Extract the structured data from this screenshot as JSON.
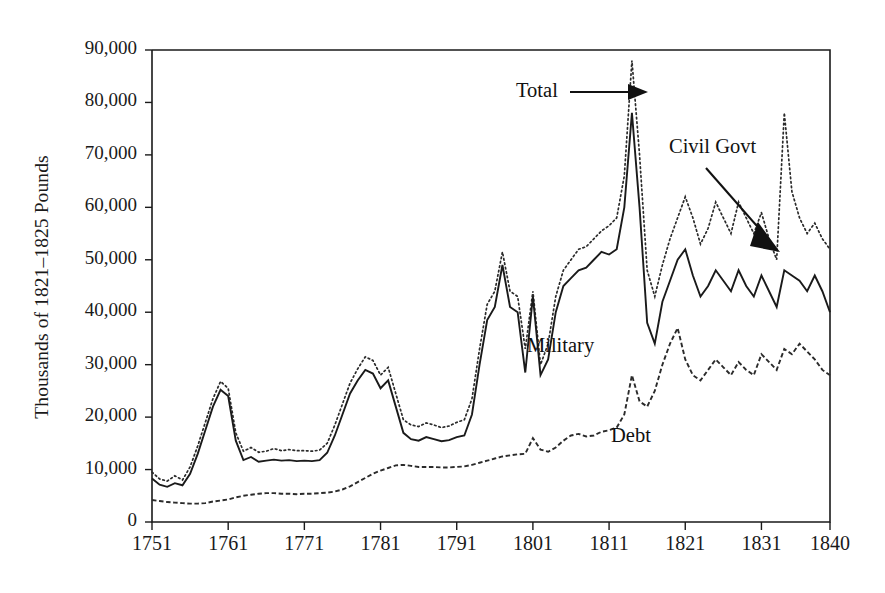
{
  "chart_data": {
    "type": "line",
    "title": "",
    "xlabel": "",
    "ylabel": "Thousands of 1821–1825 Pounds",
    "xlim": [
      1751,
      1840
    ],
    "ylim": [
      0,
      90000
    ],
    "grid": false,
    "legend_position": "inline-annotations",
    "x_ticks": [
      "1751",
      "1761",
      "1771",
      "1781",
      "1791",
      "1801",
      "1811",
      "1821",
      "1831",
      "1840"
    ],
    "x_tick_values": [
      1751,
      1761,
      1771,
      1781,
      1791,
      1801,
      1811,
      1821,
      1831,
      1840
    ],
    "y_ticks": [
      "0",
      "10,000",
      "20,000",
      "30,000",
      "40,000",
      "50,000",
      "60,000",
      "70,000",
      "80,000",
      "90,000"
    ],
    "y_tick_values": [
      0,
      10000,
      20000,
      30000,
      40000,
      50000,
      60000,
      70000,
      80000,
      90000
    ],
    "annotations": [
      {
        "text": "Total",
        "series": "Total",
        "arrow": "right"
      },
      {
        "text": "Civil Govt",
        "series": "Civil Govt",
        "arrow": "down-right"
      },
      {
        "text": "Military",
        "series": "Military",
        "arrow": "none"
      },
      {
        "text": "Debt",
        "series": "Debt",
        "arrow": "none"
      }
    ],
    "x": [
      1751,
      1752,
      1753,
      1754,
      1755,
      1756,
      1757,
      1758,
      1759,
      1760,
      1761,
      1762,
      1763,
      1764,
      1765,
      1766,
      1767,
      1768,
      1769,
      1770,
      1771,
      1772,
      1773,
      1774,
      1775,
      1776,
      1777,
      1778,
      1779,
      1780,
      1781,
      1782,
      1783,
      1784,
      1785,
      1786,
      1787,
      1788,
      1789,
      1790,
      1791,
      1792,
      1793,
      1794,
      1795,
      1796,
      1797,
      1798,
      1799,
      1800,
      1801,
      1802,
      1803,
      1804,
      1805,
      1806,
      1807,
      1808,
      1809,
      1810,
      1811,
      1812,
      1813,
      1814,
      1815,
      1816,
      1817,
      1818,
      1819,
      1820,
      1821,
      1822,
      1823,
      1824,
      1825,
      1826,
      1827,
      1828,
      1829,
      1830,
      1831,
      1832,
      1833,
      1834,
      1835,
      1836,
      1837,
      1838,
      1839,
      1840
    ],
    "series": [
      {
        "name": "Total",
        "style": "dotted",
        "values": [
          9500,
          8200,
          7800,
          8800,
          8000,
          10500,
          14500,
          19000,
          23500,
          26800,
          25500,
          17000,
          13500,
          14200,
          13300,
          13500,
          14000,
          13600,
          13800,
          13600,
          13600,
          13500,
          13700,
          15000,
          18500,
          22500,
          26500,
          29200,
          31500,
          30800,
          28000,
          29500,
          24500,
          19500,
          18500,
          18200,
          18900,
          18500,
          18000,
          18300,
          19000,
          19500,
          23500,
          33000,
          41500,
          44000,
          51500,
          44000,
          43000,
          33000,
          44000,
          30000,
          34000,
          43000,
          48000,
          50000,
          52000,
          52500,
          54000,
          55500,
          56500,
          58000,
          66000,
          88000,
          70000,
          48000,
          43000,
          49000,
          54000,
          58000,
          62000,
          58000,
          53000,
          56000,
          61000,
          58000,
          55000,
          61000,
          58000,
          55000,
          59000,
          54000,
          50000,
          78000,
          63000,
          58000,
          55000,
          57000,
          54000,
          52000
        ]
      },
      {
        "name": "Military",
        "style": "solid",
        "values": [
          8300,
          7100,
          6700,
          7400,
          7000,
          9200,
          13000,
          17500,
          22000,
          25200,
          24000,
          15500,
          11800,
          12400,
          11500,
          11700,
          11900,
          11700,
          11800,
          11600,
          11700,
          11600,
          11800,
          13200,
          16500,
          20500,
          24500,
          27000,
          29000,
          28300,
          25500,
          27000,
          22000,
          17000,
          15800,
          15500,
          16200,
          15800,
          15400,
          15600,
          16200,
          16500,
          20500,
          30000,
          38500,
          41000,
          49000,
          41000,
          40000,
          28500,
          43000,
          28000,
          31000,
          40000,
          45000,
          46500,
          48000,
          48500,
          50000,
          51500,
          51000,
          52000,
          60000,
          78000,
          60000,
          38000,
          34000,
          42000,
          46000,
          50000,
          52000,
          47000,
          43000,
          45000,
          48000,
          46000,
          44000,
          48000,
          45000,
          43000,
          47000,
          44000,
          41000,
          48000,
          47000,
          46000,
          44000,
          47000,
          44000,
          40000
        ]
      },
      {
        "name": "Debt",
        "style": "dashed",
        "values": [
          4200,
          4000,
          3800,
          3700,
          3600,
          3500,
          3500,
          3600,
          3900,
          4100,
          4300,
          4700,
          5000,
          5200,
          5400,
          5500,
          5500,
          5400,
          5400,
          5300,
          5400,
          5400,
          5500,
          5600,
          5800,
          6200,
          6800,
          7600,
          8400,
          9200,
          9800,
          10300,
          10800,
          10900,
          10700,
          10500,
          10500,
          10500,
          10400,
          10400,
          10500,
          10600,
          10900,
          11300,
          11700,
          12100,
          12500,
          12700,
          12900,
          13000,
          16000,
          13800,
          13400,
          14200,
          15500,
          16500,
          16800,
          16300,
          16500,
          17200,
          17500,
          18000,
          20500,
          28000,
          23000,
          22000,
          25000,
          30000,
          34000,
          37000,
          31000,
          28000,
          27000,
          29000,
          31000,
          29500,
          28000,
          30500,
          29000,
          28000,
          32000,
          30500,
          29000,
          33000,
          32000,
          34000,
          32500,
          31000,
          29000,
          28000
        ]
      }
    ]
  }
}
